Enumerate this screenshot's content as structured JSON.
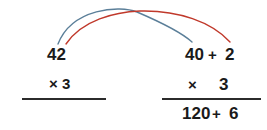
{
  "figure": {
    "background_color": "#ffffff",
    "text_color": "#1a1a1a",
    "rule_color": "#2b2b2b"
  },
  "arcs": {
    "tens_arc": {
      "label": "tens-arc",
      "color": "#5b7f99",
      "from_value": "42",
      "to_value": "40",
      "stroke_width": 1.4
    },
    "ones_arc": {
      "label": "ones-arc",
      "color": "#c0392b",
      "from_value": "42",
      "to_value": "2",
      "stroke_width": 1.4
    }
  },
  "left_column": {
    "factor": "42",
    "multiplier_sign": "×",
    "multiplier": "3",
    "multiplier_line": "× 3"
  },
  "right_column": {
    "factor_tens": "40",
    "plus_sign": "+",
    "factor_ones": "2",
    "multiplier_sign": "×",
    "multiplier": "3",
    "product_tens": "120",
    "product_plus_sign": "+",
    "product_ones": "6"
  }
}
